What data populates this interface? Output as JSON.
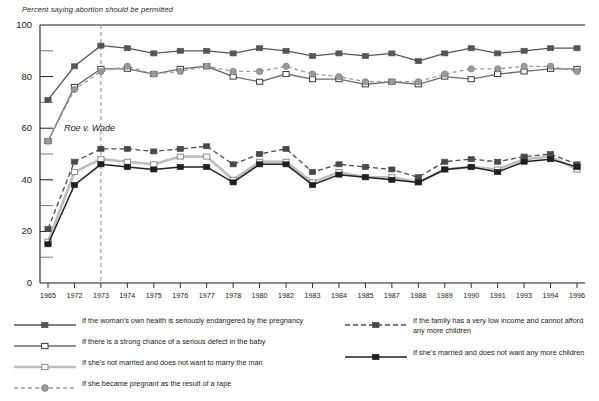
{
  "chart_data": {
    "type": "line",
    "title": "Percent saying abortion should be permitted",
    "xlabel": "",
    "ylabel": "",
    "ylim": [
      0,
      100
    ],
    "yticks": [
      0,
      20,
      40,
      60,
      80,
      100
    ],
    "yminorticks": [
      10,
      30,
      50,
      70,
      90
    ],
    "grid": false,
    "legend_position": "below",
    "categories": [
      "1965",
      "1972",
      "1973",
      "1974",
      "1975",
      "1976",
      "1977",
      "1978",
      "1980",
      "1982",
      "1983",
      "1984",
      "1985",
      "1987",
      "1988",
      "1989",
      "1990",
      "1991",
      "1993",
      "1994",
      "1996"
    ],
    "annotations": [
      {
        "label": "Roe v. Wade",
        "x": "1973",
        "type": "vertical-dashed-line"
      }
    ],
    "series": [
      {
        "name": "If the woman's own health is seriously endangered by the pregnancy",
        "key": "womans-health",
        "marker": "filled-square",
        "line": "solid",
        "color": "#555555",
        "values": [
          71,
          84,
          92,
          91,
          89,
          90,
          90,
          89,
          91,
          90,
          88,
          89,
          88,
          89,
          86,
          89,
          91,
          89,
          90,
          91,
          91
        ]
      },
      {
        "name": "If there is a strong chance of a serious defect in the baby",
        "key": "birth-defect",
        "marker": "open-square",
        "line": "solid",
        "color": "#6a6a6a",
        "values": [
          55,
          76,
          83,
          83,
          81,
          83,
          84,
          80,
          78,
          81,
          79,
          79,
          77,
          78,
          77,
          80,
          79,
          81,
          82,
          83,
          83
        ]
      },
      {
        "name": "If she's not married and does not want to marry the man",
        "key": "not-married",
        "marker": "open-square",
        "line": "solid-light",
        "color": "#bdbdbd",
        "values": [
          16,
          43,
          48,
          47,
          46,
          49,
          49,
          40,
          47,
          47,
          39,
          43,
          41,
          41,
          39,
          44,
          45,
          44,
          48,
          49,
          44
        ]
      },
      {
        "name": "If she became pregnant as the result of a rape",
        "key": "rape",
        "marker": "filled-circle",
        "line": "dashed-light",
        "color": "#9a9a9a",
        "values": [
          55,
          75,
          82,
          84,
          81,
          82,
          84,
          82,
          82,
          84,
          81,
          80,
          78,
          78,
          78,
          81,
          83,
          83,
          84,
          84,
          82
        ]
      },
      {
        "name": "If the family has a very low income and cannot afford any more children",
        "key": "low-income",
        "marker": "filled-square",
        "line": "dashed",
        "color": "#4a4a4a",
        "values": [
          21,
          47,
          52,
          52,
          51,
          52,
          53,
          46,
          50,
          52,
          43,
          46,
          45,
          44,
          41,
          47,
          48,
          47,
          49,
          50,
          46
        ]
      },
      {
        "name": "If she's married and does not want any more children",
        "key": "married-no-more",
        "marker": "filled-square",
        "line": "solid-dark",
        "color": "#1f1f1f",
        "values": [
          15,
          38,
          46,
          45,
          44,
          45,
          45,
          39,
          46,
          46,
          38,
          42,
          41,
          40,
          39,
          44,
          45,
          43,
          47,
          48,
          45
        ]
      }
    ]
  },
  "legend": {
    "items": [
      {
        "label": "If the woman's own health is seriously endangered by the pregnancy",
        "key": "womans-health"
      },
      {
        "label": "If there is a strong chance of a serious defect in the baby",
        "key": "birth-defect"
      },
      {
        "label": "If she's not married and does not want to marry the man",
        "key": "not-married"
      },
      {
        "label": "If she became pregnant as the result of a rape",
        "key": "rape"
      },
      {
        "label": "If the family has a very low income and cannot afford\nany more children",
        "key": "low-income"
      },
      {
        "label": "If she's married and does not want any more children",
        "key": "married-no-more"
      }
    ]
  },
  "colors": {
    "axis": "#1a1a1a",
    "background": "#ffffff",
    "annotation_line": "#8a8a8a"
  }
}
